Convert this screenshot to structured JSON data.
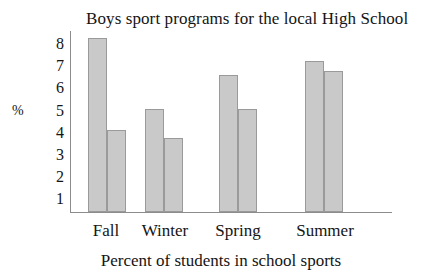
{
  "chart_data": {
    "type": "bar",
    "title": "Boys sport programs for the local High School",
    "xlabel": "Percent of students in school sports",
    "ylabel": "%",
    "categories": [
      "Fall",
      "Winter",
      "Spring",
      "Summer"
    ],
    "series": [
      {
        "name": "Series 1",
        "values": [
          8.3,
          5.05,
          6.6,
          7.25
        ]
      },
      {
        "name": "Series 2",
        "values": [
          4.1,
          3.75,
          5.05,
          6.8
        ]
      }
    ],
    "ytick_labels": [
      "8",
      "7",
      "6",
      "5",
      "4",
      "3",
      "2",
      "1"
    ],
    "ytick_values": [
      8,
      7,
      6,
      5,
      4,
      3,
      2,
      1
    ],
    "ylim": [
      0,
      8.8
    ],
    "grid": false,
    "legend": "none",
    "bar_fill_color": "#c9c9c9",
    "bar_edge_color": "#9a9a9a",
    "axis_color": "#8c8c8c",
    "text_color": "#141414",
    "background_color": "#ffffff"
  }
}
